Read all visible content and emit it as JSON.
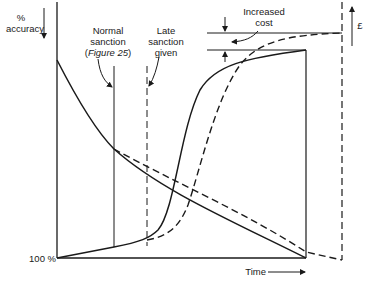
{
  "diagram": {
    "y_axis_left_label_line1": "%",
    "y_axis_left_label_line2": "accuracy",
    "y_axis_right_label": "£",
    "x_axis_label": "Time",
    "origin_label": "100 %",
    "normal_sanction_line1": "Normal",
    "normal_sanction_line2": "sanction",
    "normal_sanction_line3_prefix": "(",
    "normal_sanction_line3_italic": "Figure 25",
    "normal_sanction_line3_suffix": ")",
    "late_sanction_line1": "Late",
    "late_sanction_line2": "sanction",
    "late_sanction_line3": "given",
    "increased_cost_line1": "Increased",
    "increased_cost_line2": "cost"
  },
  "colors": {
    "ink": "#1a1a1a",
    "background": "#ffffff"
  }
}
